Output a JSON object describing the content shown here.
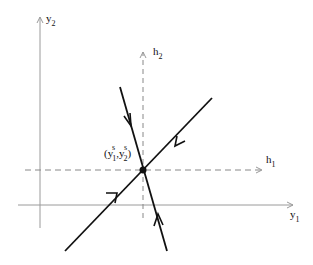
{
  "diagram": {
    "type": "phase-portrait-saddle",
    "axes": {
      "vertical": {
        "label": "y",
        "sub": "2"
      },
      "horizontal": {
        "label": "y",
        "sub": "1"
      }
    },
    "shifted_axes": {
      "vertical": {
        "label": "h",
        "sub": "2"
      },
      "horizontal": {
        "label": "h",
        "sub": "1"
      }
    },
    "equilibrium": {
      "label_open": "(y",
      "label_sup1": "s",
      "label_sub1": "1",
      "label_sep": ",y",
      "label_sup2": "s",
      "label_sub2": "2",
      "label_close": ")"
    },
    "colors": {
      "axis": "#9a9a9a",
      "line": "#111111",
      "dashed": "#888888"
    }
  }
}
